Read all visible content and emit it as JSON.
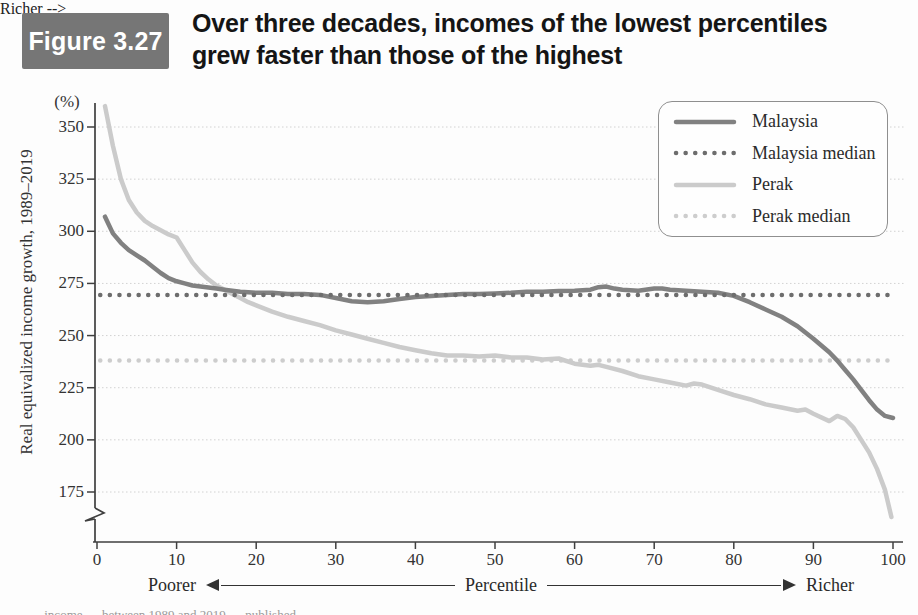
{
  "figure": {
    "label": "Figure 3.27",
    "title_line1": "Over three decades, incomes of the lowest percentiles",
    "title_line2": "grew faster than those of the highest"
  },
  "chart_data": {
    "type": "line",
    "title": "Over three decades, incomes of the lowest percentiles grew faster than those of the highest",
    "ylabel": "Real equivalized income growth, 1989–2019",
    "y_unit_label": "(%)",
    "xlabel": "Percentile",
    "x_axis_annotation_left": "Poorer",
    "x_axis_annotation_right": "Richer",
    "xlim": [
      0,
      100
    ],
    "ylim_shown": [
      175,
      350
    ],
    "y_axis_break_below": 175,
    "grid": "horizontal",
    "legend_position": "top-right",
    "yticks": [
      350,
      325,
      300,
      275,
      250,
      225,
      200,
      175
    ],
    "xticks": [
      0,
      10,
      20,
      30,
      40,
      50,
      60,
      70,
      80,
      90,
      100
    ],
    "series": [
      {
        "name": "Malaysia",
        "style": "solid",
        "color": "#818181",
        "width": 4.5,
        "points": [
          [
            1,
            307
          ],
          [
            2,
            299
          ],
          [
            3,
            294.5
          ],
          [
            4,
            291
          ],
          [
            5,
            288.5
          ],
          [
            6,
            286
          ],
          [
            7,
            283
          ],
          [
            8,
            280
          ],
          [
            9,
            277.5
          ],
          [
            10,
            276
          ],
          [
            11,
            275
          ],
          [
            12,
            274
          ],
          [
            13,
            273.5
          ],
          [
            14,
            273
          ],
          [
            15,
            272.5
          ],
          [
            16,
            272
          ],
          [
            17,
            271.5
          ],
          [
            18,
            271
          ],
          [
            19,
            270.8
          ],
          [
            20,
            270.5
          ],
          [
            22,
            270.5
          ],
          [
            24,
            270
          ],
          [
            26,
            270
          ],
          [
            28,
            269.5
          ],
          [
            30,
            268
          ],
          [
            32,
            266.5
          ],
          [
            34,
            266
          ],
          [
            36,
            266.5
          ],
          [
            38,
            267.5
          ],
          [
            40,
            268.5
          ],
          [
            42,
            269
          ],
          [
            44,
            269.5
          ],
          [
            46,
            270
          ],
          [
            48,
            270
          ],
          [
            50,
            270.2
          ],
          [
            52,
            270.5
          ],
          [
            54,
            271
          ],
          [
            56,
            271
          ],
          [
            58,
            271.3
          ],
          [
            60,
            271.5
          ],
          [
            62,
            272
          ],
          [
            63,
            273.2
          ],
          [
            64,
            273.5
          ],
          [
            65,
            272.5
          ],
          [
            66,
            272
          ],
          [
            68,
            271.5
          ],
          [
            70,
            272.5
          ],
          [
            71,
            272.5
          ],
          [
            72,
            272
          ],
          [
            74,
            271.5
          ],
          [
            76,
            271
          ],
          [
            78,
            270.5
          ],
          [
            80,
            269
          ],
          [
            82,
            266
          ],
          [
            84,
            262.5
          ],
          [
            86,
            259
          ],
          [
            88,
            254.5
          ],
          [
            90,
            248.5
          ],
          [
            92,
            242
          ],
          [
            93,
            238
          ],
          [
            94,
            233.5
          ],
          [
            95,
            229
          ],
          [
            96,
            224
          ],
          [
            97,
            219
          ],
          [
            98,
            214.5
          ],
          [
            99,
            211.5
          ],
          [
            100,
            210.5
          ]
        ]
      },
      {
        "name": "Malaysia median",
        "style": "dotted",
        "color": "#6d6d6d",
        "width": 4.5,
        "median_value": 269.5,
        "points": [
          [
            0.4,
            269.5
          ],
          [
            100,
            269.5
          ]
        ]
      },
      {
        "name": "Perak",
        "style": "solid",
        "color": "#cbcbcb",
        "width": 4.5,
        "points": [
          [
            1,
            360
          ],
          [
            2,
            341
          ],
          [
            3,
            325
          ],
          [
            4,
            315
          ],
          [
            5,
            309
          ],
          [
            6,
            305
          ],
          [
            7,
            302.5
          ],
          [
            8,
            300.5
          ],
          [
            9,
            298.5
          ],
          [
            10,
            297
          ],
          [
            11,
            291
          ],
          [
            12,
            285
          ],
          [
            13,
            280.5
          ],
          [
            14,
            277
          ],
          [
            15,
            274
          ],
          [
            16,
            272
          ],
          [
            17,
            270
          ],
          [
            18,
            268
          ],
          [
            19,
            266
          ],
          [
            20,
            264.5
          ],
          [
            22,
            261.5
          ],
          [
            24,
            259
          ],
          [
            26,
            257
          ],
          [
            28,
            255
          ],
          [
            30,
            252.5
          ],
          [
            32,
            250.5
          ],
          [
            34,
            248.5
          ],
          [
            36,
            246.5
          ],
          [
            38,
            244.5
          ],
          [
            40,
            243
          ],
          [
            42,
            241.5
          ],
          [
            44,
            240.5
          ],
          [
            46,
            240.5
          ],
          [
            48,
            240
          ],
          [
            50,
            240.5
          ],
          [
            52,
            239.5
          ],
          [
            54,
            239.5
          ],
          [
            56,
            238.5
          ],
          [
            58,
            239
          ],
          [
            60,
            236.5
          ],
          [
            62,
            235.5
          ],
          [
            63,
            236
          ],
          [
            64,
            235
          ],
          [
            66,
            233
          ],
          [
            68,
            230.5
          ],
          [
            70,
            229
          ],
          [
            72,
            227.5
          ],
          [
            74,
            226
          ],
          [
            75,
            227
          ],
          [
            76,
            226.5
          ],
          [
            78,
            224
          ],
          [
            80,
            221.5
          ],
          [
            82,
            219.5
          ],
          [
            84,
            217
          ],
          [
            86,
            215.5
          ],
          [
            88,
            214
          ],
          [
            89,
            214.5
          ],
          [
            90,
            212.5
          ],
          [
            92,
            209
          ],
          [
            93,
            211.5
          ],
          [
            94,
            210
          ],
          [
            95,
            206
          ],
          [
            96,
            200
          ],
          [
            97,
            194
          ],
          [
            98,
            186
          ],
          [
            99,
            176
          ],
          [
            99.8,
            163
          ]
        ]
      },
      {
        "name": "Perak median",
        "style": "dotted",
        "color": "#cdcdcd",
        "width": 4.5,
        "median_value": 238,
        "points": [
          [
            0.4,
            238
          ],
          [
            100,
            238
          ]
        ]
      }
    ]
  },
  "note_partial": "… income … between 1989 and 2019 … published"
}
